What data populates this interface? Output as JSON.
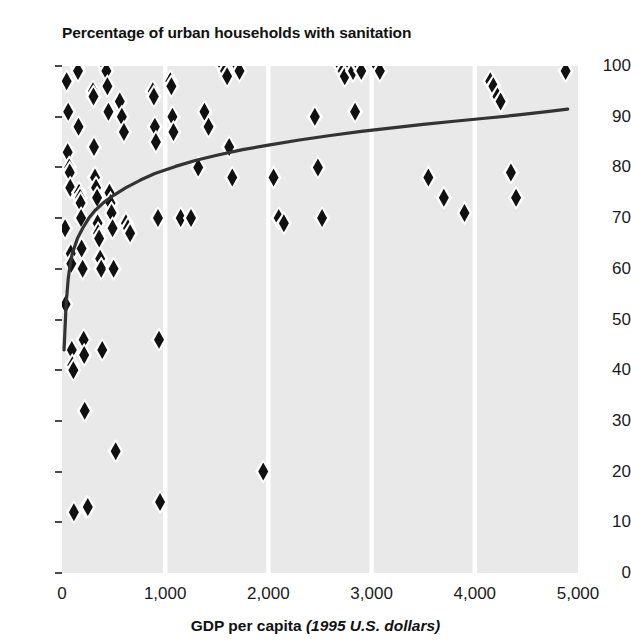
{
  "chart_data": {
    "type": "scatter",
    "title": "Percentage of urban households with sanitation",
    "xlabel_bold": "GDP per capita",
    "xlabel_italic": "(1995 U.S. dollars)",
    "ylabel": "",
    "xlim": [
      0,
      5000
    ],
    "ylim": [
      0,
      100
    ],
    "xticks": [
      0,
      1000,
      2000,
      3000,
      4000,
      5000
    ],
    "xtick_labels": [
      "0",
      "1,000",
      "2,000",
      "3,000",
      "4,000",
      "5,000"
    ],
    "yticks": [
      0,
      10,
      20,
      30,
      40,
      50,
      60,
      70,
      80,
      90,
      100
    ],
    "ytick_labels": [
      "0",
      "10",
      "20",
      "30",
      "40",
      "50",
      "60",
      "70",
      "80",
      "90",
      "100"
    ],
    "grid": "vertical-white-gridlines",
    "legend": "none",
    "marker": "diamond",
    "marker_color": "#111111",
    "marker_halo_color": "#ffffff",
    "plot_background": "#e9e9e9",
    "trend_line_color": "#333333",
    "points": [
      [
        30,
        68
      ],
      [
        35,
        53
      ],
      [
        45,
        97
      ],
      [
        55,
        83
      ],
      [
        60,
        91
      ],
      [
        70,
        80
      ],
      [
        75,
        79
      ],
      [
        80,
        76
      ],
      [
        85,
        63
      ],
      [
        90,
        61
      ],
      [
        95,
        44
      ],
      [
        100,
        41
      ],
      [
        110,
        40
      ],
      [
        115,
        12
      ],
      [
        150,
        100
      ],
      [
        155,
        99
      ],
      [
        160,
        88
      ],
      [
        165,
        75
      ],
      [
        175,
        74
      ],
      [
        180,
        73
      ],
      [
        185,
        70
      ],
      [
        190,
        64
      ],
      [
        200,
        60
      ],
      [
        210,
        46
      ],
      [
        215,
        43
      ],
      [
        220,
        32
      ],
      [
        235,
        13
      ],
      [
        250,
        13
      ],
      [
        300,
        95
      ],
      [
        305,
        94
      ],
      [
        310,
        84
      ],
      [
        320,
        78
      ],
      [
        330,
        76
      ],
      [
        340,
        74
      ],
      [
        345,
        69
      ],
      [
        350,
        67
      ],
      [
        360,
        66
      ],
      [
        370,
        62
      ],
      [
        380,
        60
      ],
      [
        390,
        44
      ],
      [
        420,
        100
      ],
      [
        430,
        99
      ],
      [
        440,
        96
      ],
      [
        450,
        91
      ],
      [
        460,
        75
      ],
      [
        470,
        73
      ],
      [
        480,
        71
      ],
      [
        490,
        68
      ],
      [
        500,
        60
      ],
      [
        520,
        24
      ],
      [
        560,
        93
      ],
      [
        580,
        90
      ],
      [
        600,
        87
      ],
      [
        620,
        69
      ],
      [
        640,
        68
      ],
      [
        660,
        67
      ],
      [
        880,
        95
      ],
      [
        890,
        94
      ],
      [
        900,
        88
      ],
      [
        910,
        85
      ],
      [
        930,
        70
      ],
      [
        940,
        46
      ],
      [
        950,
        14
      ],
      [
        1050,
        97
      ],
      [
        1060,
        96
      ],
      [
        1070,
        90
      ],
      [
        1080,
        87
      ],
      [
        1150,
        70
      ],
      [
        1250,
        70
      ],
      [
        1320,
        80
      ],
      [
        1380,
        91
      ],
      [
        1420,
        88
      ],
      [
        1560,
        100
      ],
      [
        1580,
        99
      ],
      [
        1600,
        98
      ],
      [
        1620,
        84
      ],
      [
        1650,
        78
      ],
      [
        1700,
        100
      ],
      [
        1720,
        99
      ],
      [
        1950,
        20
      ],
      [
        2050,
        78
      ],
      [
        2100,
        70
      ],
      [
        2150,
        69
      ],
      [
        2450,
        90
      ],
      [
        2480,
        80
      ],
      [
        2520,
        70
      ],
      [
        2700,
        100
      ],
      [
        2720,
        99
      ],
      [
        2740,
        98
      ],
      [
        2800,
        100
      ],
      [
        2820,
        99
      ],
      [
        2840,
        91
      ],
      [
        2880,
        100
      ],
      [
        2900,
        99
      ],
      [
        3050,
        100
      ],
      [
        3080,
        99
      ],
      [
        3550,
        78
      ],
      [
        3700,
        74
      ],
      [
        3900,
        71
      ],
      [
        4150,
        97
      ],
      [
        4180,
        96
      ],
      [
        4220,
        94
      ],
      [
        4250,
        93
      ],
      [
        4350,
        79
      ],
      [
        4400,
        74
      ],
      [
        4880,
        99
      ]
    ],
    "trend_line": [
      [
        20,
        44
      ],
      [
        40,
        53
      ],
      [
        60,
        58
      ],
      [
        80,
        61
      ],
      [
        100,
        63
      ],
      [
        150,
        66
      ],
      [
        200,
        68
      ],
      [
        260,
        70
      ],
      [
        320,
        71.5
      ],
      [
        400,
        73
      ],
      [
        500,
        74.5
      ],
      [
        620,
        76
      ],
      [
        760,
        77.5
      ],
      [
        900,
        78.8
      ],
      [
        1100,
        80.2
      ],
      [
        1300,
        81.4
      ],
      [
        1500,
        82.4
      ],
      [
        1750,
        83.5
      ],
      [
        2000,
        84.4
      ],
      [
        2300,
        85.4
      ],
      [
        2600,
        86.3
      ],
      [
        2900,
        87.1
      ],
      [
        3200,
        87.8
      ],
      [
        3500,
        88.5
      ],
      [
        3800,
        89.1
      ],
      [
        4100,
        89.7
      ],
      [
        4400,
        90.3
      ],
      [
        4700,
        91.0
      ],
      [
        4900,
        91.5
      ]
    ]
  }
}
